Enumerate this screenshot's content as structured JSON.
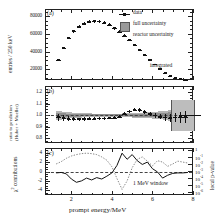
{
  "figure": {
    "panels": [
      {
        "tag": "(a)"
      },
      {
        "tag": "(b)"
      },
      {
        "tag": "(c)"
      }
    ],
    "xlabel": "prompt energy/MeV",
    "xticks": [
      "2",
      "4",
      "6",
      "8"
    ],
    "annotations": {
      "integrated": "integrated",
      "window": "1 MeV window"
    },
    "legend": [
      {
        "label": "data",
        "marker": "point-with-errorbar",
        "color": "#111111"
      },
      {
        "label": "full uncertainty",
        "marker": "filled-square",
        "color": "#9a9a9a"
      },
      {
        "label": "reactor uncertainty",
        "marker": "none",
        "color": "#8e8e8e"
      }
    ]
  },
  "chart_data": [
    {
      "type": "scatter",
      "panel": "(a)",
      "title": "",
      "xlabel": "prompt energy/MeV",
      "ylabel": "entries / 250 keV",
      "xlim": [
        0.7,
        8.0
      ],
      "ylim": [
        8000,
        88000
      ],
      "yticks": [
        20000,
        40000,
        60000,
        80000
      ],
      "ytick_labels": [
        "20000",
        "40000",
        "60000",
        "80000"
      ],
      "grid": false,
      "x": [
        1.375,
        1.625,
        1.875,
        2.125,
        2.375,
        2.625,
        2.875,
        3.125,
        3.375,
        3.625,
        3.875,
        4.125,
        4.375,
        4.625,
        4.875,
        5.125,
        5.375,
        5.625,
        5.875,
        6.125,
        6.375,
        6.625,
        6.875,
        7.125,
        7.375,
        7.625
      ],
      "y": [
        31000,
        44000,
        55500,
        63000,
        68000,
        71500,
        73500,
        74200,
        74000,
        72600,
        70000,
        66500,
        62500,
        58000,
        53000,
        47500,
        42000,
        36500,
        31000,
        25500,
        20500,
        16000,
        12500,
        10000,
        9000,
        8500
      ],
      "yerr": [
        1200,
        1400,
        1500,
        1600,
        1700,
        1700,
        1800,
        1800,
        1800,
        1800,
        1700,
        1700,
        1600,
        1600,
        1500,
        1400,
        1300,
        1200,
        1100,
        1000,
        900,
        800,
        700,
        650,
        600,
        600
      ],
      "series_label": "data"
    },
    {
      "type": "scatter",
      "panel": "(b)",
      "title": "",
      "xlabel": "prompt energy/MeV",
      "ylabel": "ratio to prediction (Huber + Mueller)",
      "xlim": [
        0.7,
        8.0
      ],
      "ylim": [
        0.76,
        1.255
      ],
      "yticks": [
        0.8,
        0.9,
        1.0,
        1.1,
        1.2
      ],
      "ytick_labels": [
        "0.8",
        "0.9",
        "1.0",
        "1.1",
        "1.2"
      ],
      "reference_line": 1.0,
      "grid": false,
      "x": [
        1.375,
        1.625,
        1.875,
        2.125,
        2.375,
        2.625,
        2.875,
        3.125,
        3.375,
        3.625,
        3.875,
        4.125,
        4.375,
        4.625,
        4.875,
        5.125,
        5.375,
        5.625,
        5.875,
        6.125,
        6.375,
        6.625,
        6.875,
        7.125,
        7.375,
        7.625
      ],
      "y": [
        0.985,
        0.978,
        0.972,
        0.968,
        0.966,
        0.968,
        0.97,
        0.972,
        0.973,
        0.974,
        0.976,
        0.98,
        0.99,
        1.012,
        1.035,
        1.048,
        1.045,
        1.032,
        1.015,
        1.0,
        0.99,
        0.982,
        0.98,
        0.982,
        0.985,
        0.988
      ],
      "yerr": [
        0.03,
        0.024,
        0.02,
        0.017,
        0.015,
        0.014,
        0.013,
        0.013,
        0.012,
        0.012,
        0.012,
        0.012,
        0.012,
        0.013,
        0.013,
        0.014,
        0.015,
        0.016,
        0.018,
        0.021,
        0.025,
        0.03,
        0.036,
        0.042,
        0.048,
        0.052
      ],
      "full_uncertainty_band": [
        0.04,
        0.032,
        0.026,
        0.022,
        0.02,
        0.018,
        0.017,
        0.016,
        0.016,
        0.015,
        0.015,
        0.015,
        0.016,
        0.017,
        0.018,
        0.019,
        0.021,
        0.023,
        0.026,
        0.03,
        0.035,
        0.041,
        0.048,
        0.055,
        0.062,
        0.068
      ],
      "integrated_bin": {
        "x_range": [
          6.9,
          8.0
        ],
        "center": 1.0,
        "halfwidth": 0.135
      }
    },
    {
      "type": "line",
      "panel": "(c)",
      "title": "",
      "xlabel": "prompt energy/MeV",
      "ylabel": "χ² contributions",
      "ylabel_right": "local p-value",
      "xlim": [
        0.7,
        8.0
      ],
      "ylim": [
        -5.0,
        5.0
      ],
      "yticks": [
        -4,
        -2,
        0,
        2,
        4
      ],
      "ytick_labels": [
        "-4",
        "-2",
        "0",
        "2",
        "4"
      ],
      "right_ytick_labels": [
        "1",
        "10",
        "10",
        "10",
        "10",
        "10",
        "10"
      ],
      "right_ytick_exponents": [
        "",
        "-1",
        "-2",
        "-3",
        "-4",
        "-5",
        "-6"
      ],
      "reference_line": 0,
      "grid": false,
      "series": [
        {
          "name": "chi2 contribution",
          "style": "solid",
          "color": "#111111",
          "x": [
            1.25,
            1.5,
            1.75,
            2.0,
            2.25,
            2.5,
            2.75,
            3.0,
            3.25,
            3.5,
            3.75,
            4.0,
            4.25,
            4.5,
            4.75,
            5.0,
            5.25,
            5.5,
            5.75,
            6.0,
            6.25,
            6.5,
            6.75,
            7.0,
            7.25,
            7.5,
            7.75
          ],
          "y": [
            -0.3,
            -0.2,
            -0.5,
            -1.6,
            -2.3,
            -2.0,
            -1.4,
            -1.8,
            -1.3,
            -1.6,
            -1.0,
            -0.3,
            1.3,
            3.9,
            2.6,
            3.6,
            2.3,
            1.5,
            2.0,
            0.6,
            -0.1,
            -1.4,
            -0.8,
            -0.4,
            -0.3,
            -0.3,
            -0.2
          ]
        },
        {
          "name": "local p-value",
          "style": "dotted",
          "color": "#7a7a7a",
          "x": [
            1.25,
            1.5,
            1.75,
            2.0,
            2.25,
            2.5,
            2.75,
            3.0,
            3.25,
            3.5,
            3.75,
            4.0,
            4.25,
            4.5,
            4.75,
            5.0,
            5.25,
            5.5,
            5.75,
            6.0,
            6.25,
            6.5,
            6.75,
            7.0,
            7.25,
            7.5,
            7.75
          ],
          "y": [
            1.6,
            2.1,
            2.8,
            3.3,
            3.6,
            3.8,
            3.9,
            3.8,
            3.6,
            3.1,
            2.4,
            1.0,
            -1.5,
            -3.8,
            -2.0,
            0.8,
            2.6,
            3.1,
            2.2,
            1.2,
            2.3,
            2.0,
            1.1,
            1.6,
            2.2,
            2.0,
            1.8
          ]
        }
      ]
    }
  ]
}
